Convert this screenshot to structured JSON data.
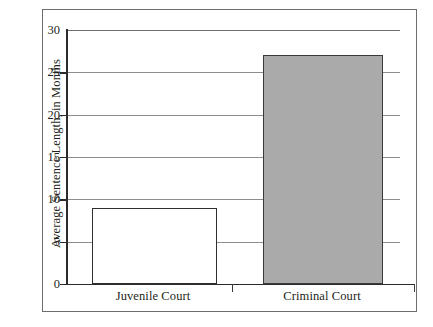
{
  "chart_data": {
    "type": "bar",
    "title": "",
    "subtitle": "",
    "xlabel": "",
    "ylabel": "Average Sentence Length, in Months",
    "categories": [
      "Juvenile Court",
      "Criminal Court"
    ],
    "values": [
      9,
      27
    ],
    "ylim": [
      0,
      30
    ],
    "yticks": [
      0,
      5,
      10,
      15,
      20,
      25,
      30
    ],
    "ytick_labels": [
      "0",
      "5",
      "10",
      "15",
      "20",
      "25",
      "30"
    ],
    "grid": true,
    "legend": "none",
    "series": [
      {
        "name": "Average Sentence Length",
        "values": [
          9,
          27
        ]
      }
    ],
    "bar_styles": [
      {
        "category": "Juvenile Court",
        "fill": "#ffffff",
        "stroke": "#2f2f2f"
      },
      {
        "category": "Criminal Court",
        "fill": "#aaaaaa",
        "stroke": "#3a3a3a"
      }
    ],
    "colors": {
      "juvenile_fill": "#ffffff",
      "criminal_fill": "#aaaaaa",
      "axis": "#2b2b2b",
      "gridline": "#8d8d8d",
      "frame": "#6d6d6d",
      "text": "#231f20"
    }
  }
}
